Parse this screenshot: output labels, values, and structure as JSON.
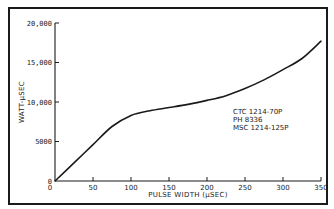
{
  "chart_data": {
    "type": "line",
    "title": "",
    "xlabel": "PULSE WIDTH (µSEC)",
    "ylabel": "WATT-µSEC",
    "xlim": [
      0,
      350
    ],
    "ylim": [
      0,
      20000
    ],
    "x_ticks": [
      0,
      50,
      100,
      150,
      200,
      250,
      300,
      350
    ],
    "x_tick_labels": [
      "0",
      "50",
      "100",
      "150",
      "200",
      "250",
      "300",
      "350"
    ],
    "y_ticks": [
      0,
      5000,
      10000,
      15000,
      20000
    ],
    "y_tick_labels": [
      "0",
      "5000",
      "10,000",
      "15,000",
      "20,000"
    ],
    "grid": false,
    "legend": null,
    "series": [
      {
        "name": "CTC 1214-70P / PH 8336 / MSC 1214-125P",
        "x": [
          0,
          25,
          50,
          75,
          100,
          125,
          150,
          175,
          200,
          225,
          250,
          275,
          300,
          325,
          350
        ],
        "y": [
          0,
          2300,
          4600,
          6900,
          8300,
          8900,
          9300,
          9700,
          10200,
          10800,
          11700,
          12800,
          14100,
          15500,
          17700
        ]
      }
    ],
    "annotations": [
      "CTC 1214-70P",
      "PH 8336",
      "MSC 1214-125P"
    ]
  }
}
